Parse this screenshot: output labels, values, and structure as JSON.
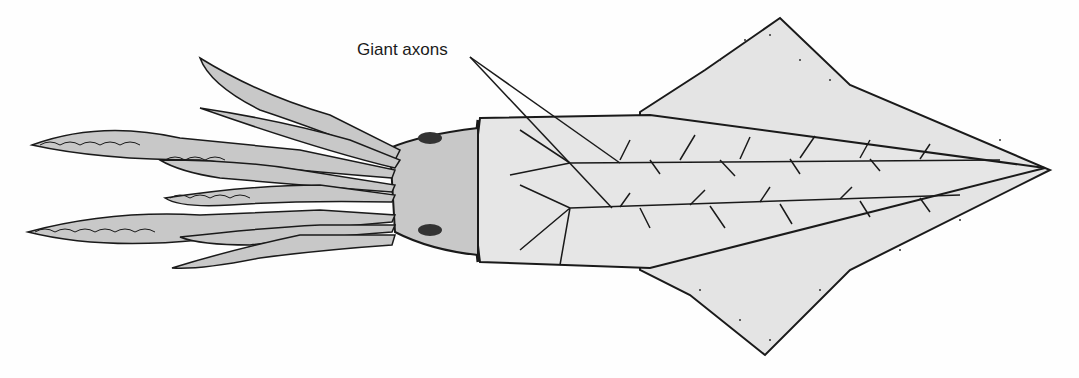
{
  "figure": {
    "labels": [
      {
        "text": "Giant axons",
        "targets": [
          "upper giant axon",
          "lower giant axon"
        ]
      }
    ],
    "colors": {
      "body_fill": "#c8c8c8",
      "mantle_fill": "#e4e4e4",
      "outline": "#1a1a1a",
      "background": "#fefefe"
    }
  }
}
